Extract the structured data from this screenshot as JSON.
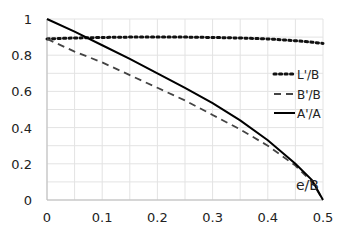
{
  "chart_data": {
    "type": "line",
    "title": "",
    "xlabel": "e/B",
    "ylabel": "",
    "xlim": [
      0,
      0.5
    ],
    "ylim": [
      0,
      1
    ],
    "grid": true,
    "legend_position": "right-middle",
    "x_ticks": [
      "0",
      "0.1",
      "0.2",
      "0.3",
      "0.4",
      "0.5"
    ],
    "y_ticks": [
      "0",
      "0.2",
      "0.4",
      "0.6",
      "0.8",
      "1"
    ],
    "x": [
      0,
      0.05,
      0.1,
      0.15,
      0.2,
      0.25,
      0.3,
      0.35,
      0.4,
      0.45,
      0.48,
      0.5
    ],
    "series": [
      {
        "name": "L'/B",
        "style": "dotted",
        "values": [
          0.89,
          0.895,
          0.898,
          0.9,
          0.9,
          0.9,
          0.898,
          0.895,
          0.89,
          0.88,
          0.872,
          0.865
        ]
      },
      {
        "name": "B'/B",
        "style": "dashed",
        "values": [
          0.89,
          0.82,
          0.76,
          0.69,
          0.62,
          0.55,
          0.47,
          0.39,
          0.3,
          0.19,
          0.1,
          0.0
        ]
      },
      {
        "name": "A'/A",
        "style": "solid",
        "values": [
          1.0,
          0.93,
          0.855,
          0.78,
          0.7,
          0.62,
          0.535,
          0.44,
          0.33,
          0.2,
          0.11,
          0.0
        ]
      }
    ]
  }
}
